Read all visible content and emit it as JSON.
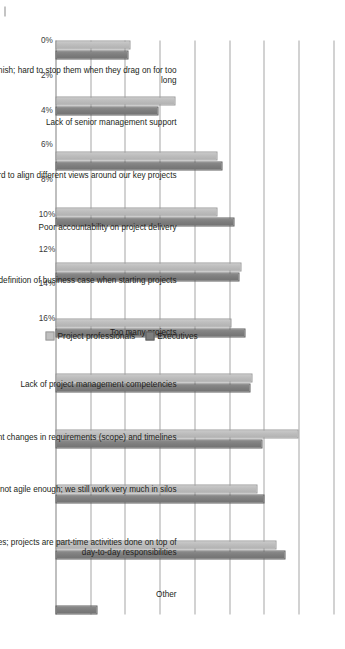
{
  "chart_data": {
    "type": "bar",
    "orientation": "vertical-rotated-90",
    "title": "",
    "xlabel": "",
    "ylabel": "",
    "ylim": [
      0,
      16
    ],
    "grid": true,
    "legend_position": "bottom-right",
    "axis_ticks": [
      "0%",
      "2%",
      "4%",
      "6%",
      "8%",
      "10%",
      "12%",
      "14%",
      "16%"
    ],
    "axis_tick_values": [
      0,
      2,
      4,
      6,
      8,
      10,
      12,
      14,
      16
    ],
    "categories": [
      "Projects rarely finish; hard to stop them when they drag on for too long",
      "Lack of senior management support",
      "Hard to align different views around our key projects",
      "Poor accountability on project delivery",
      "Poor definition of business case when starting projects",
      "Too many projects",
      "Lack of project management competencies",
      "Frequent changes in requirements (scope) and timelines",
      "Our culture is not agile enough; we still work very much in silos",
      "Lack of resources; projects are part-time activities done on top of day-to-day responsibilities",
      "Other"
    ],
    "series": [
      {
        "name": "Project professionals",
        "color": "#c0c0c0",
        "values": [
          4.2,
          6.8,
          9.2,
          9.2,
          10.6,
          10.0,
          11.2,
          13.9,
          11.5,
          12.6,
          0
        ]
      },
      {
        "name": "Executives",
        "color": "#7e7e7e",
        "values": [
          4.1,
          5.8,
          9.5,
          10.2,
          10.5,
          10.8,
          11.1,
          11.8,
          11.9,
          13.1,
          2.3
        ]
      }
    ]
  },
  "legend": {
    "items": [
      {
        "label": "Project professionals",
        "swatch": "light-gray"
      },
      {
        "label": "Executives",
        "swatch": "dark-gray"
      }
    ]
  },
  "colors": {
    "series_light": "#c0c0c0",
    "series_dark": "#7e7e7e",
    "gridline": "#a6a6a6",
    "text": "#231f20",
    "background": "#ffffff"
  }
}
